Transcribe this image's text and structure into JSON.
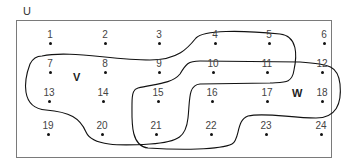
{
  "universe": {
    "label": "U"
  },
  "sets": [
    {
      "name": "V",
      "label": "V",
      "label_pos": [
        73,
        71
      ],
      "members": [
        4,
        5,
        7,
        8,
        9,
        10,
        11,
        13,
        14,
        15,
        20,
        21
      ]
    },
    {
      "name": "W",
      "label": "W",
      "label_pos": [
        292,
        87
      ],
      "members": [
        10,
        11,
        12,
        15,
        16,
        17,
        18,
        21,
        22
      ]
    }
  ],
  "elements": [
    {
      "n": "1",
      "x": 50,
      "y": 38
    },
    {
      "n": "2",
      "x": 105,
      "y": 38
    },
    {
      "n": "3",
      "x": 159,
      "y": 38
    },
    {
      "n": "4",
      "x": 215,
      "y": 38
    },
    {
      "n": "5",
      "x": 269,
      "y": 38
    },
    {
      "n": "6",
      "x": 324,
      "y": 38
    },
    {
      "n": "7",
      "x": 50,
      "y": 67
    },
    {
      "n": "8",
      "x": 105,
      "y": 67
    },
    {
      "n": "9",
      "x": 159,
      "y": 67
    },
    {
      "n": "10",
      "x": 213,
      "y": 67
    },
    {
      "n": "11",
      "x": 267,
      "y": 67
    },
    {
      "n": "12",
      "x": 322,
      "y": 67
    },
    {
      "n": "13",
      "x": 49,
      "y": 96
    },
    {
      "n": "14",
      "x": 103,
      "y": 96
    },
    {
      "n": "15",
      "x": 158,
      "y": 96
    },
    {
      "n": "16",
      "x": 212,
      "y": 96
    },
    {
      "n": "17",
      "x": 267,
      "y": 96
    },
    {
      "n": "18",
      "x": 322,
      "y": 96
    },
    {
      "n": "19",
      "x": 48,
      "y": 129
    },
    {
      "n": "20",
      "x": 102,
      "y": 129
    },
    {
      "n": "21",
      "x": 156,
      "y": 129
    },
    {
      "n": "22",
      "x": 211,
      "y": 129
    },
    {
      "n": "23",
      "x": 266,
      "y": 129
    },
    {
      "n": "24",
      "x": 321,
      "y": 129
    }
  ]
}
